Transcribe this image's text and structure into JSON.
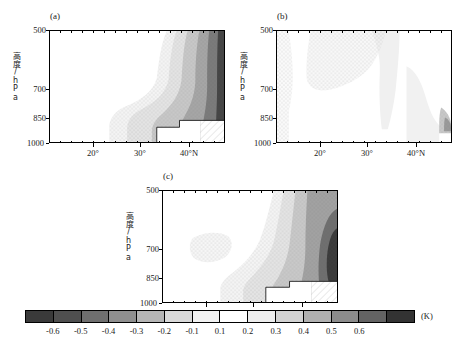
{
  "figure": {
    "unit_label": "(K)",
    "axis": {
      "ylabel": "高度/hPa",
      "ytick_labels": [
        "500",
        "700",
        "850",
        "1000"
      ],
      "ytick_values": [
        500,
        700,
        850,
        1000
      ],
      "ytick_positions_pct": [
        0,
        52,
        78,
        100
      ],
      "xtick_labels": [
        "20°",
        "30°",
        "40°N"
      ],
      "xtick_values": [
        20,
        30,
        40
      ],
      "xlim": [
        15,
        47
      ],
      "ylim_hpa": [
        500,
        1000
      ]
    },
    "panels": [
      {
        "id": "a",
        "label": "(a)"
      },
      {
        "id": "b",
        "label": "(b)"
      },
      {
        "id": "c",
        "label": "(c)"
      }
    ]
  },
  "chart_data": {
    "type": "heatmap",
    "title": "",
    "xlabel": "",
    "ylabel": "高度/hPa",
    "unit": "K",
    "grid": false,
    "legend_position": "bottom",
    "axis_ranges": {
      "x": [
        15,
        47
      ],
      "y": [
        1000,
        500
      ]
    },
    "colorbar": {
      "label": "(K)",
      "tick_labels": [
        "-0.6",
        "-0.5",
        "-0.4",
        "-0.3",
        "-0.2",
        "-0.1",
        "0.1",
        "0.2",
        "0.3",
        "0.4",
        "0.5",
        "0.6"
      ],
      "levels": [
        -0.6,
        -0.5,
        -0.4,
        -0.3,
        -0.2,
        -0.1,
        0.1,
        0.2,
        0.3,
        0.4,
        0.5,
        0.6
      ],
      "swatch_colors": [
        "#3a3a3a",
        "#4f4f4f",
        "#6f6f6f",
        "#8f8f8f",
        "#b5b5b5",
        "#d9d9d9",
        "#f2f2f2",
        "#ffffff",
        "#ededed",
        "#d2d2d2",
        "#b0b0b0",
        "#8c8c8c",
        "#636363",
        "#333333"
      ],
      "n_segments": 14
    },
    "panels": [
      {
        "id": "a",
        "label": "(a)",
        "description": "Warm anomaly band increasing eastward/northward; values rise from 0.1 K near 25°N to above 0.6 K at 46°N; white terrain mask at lower right corner.",
        "contours": [
          {
            "level": 0.1,
            "color": "#f2f2f2"
          },
          {
            "level": 0.2,
            "color": "#e0e0e0"
          },
          {
            "level": 0.3,
            "color": "#c6c6c6"
          },
          {
            "level": 0.4,
            "color": "#a8a8a8"
          },
          {
            "level": 0.5,
            "color": "#7d7d7d"
          },
          {
            "level": 0.6,
            "color": "#4a4a4a"
          }
        ]
      },
      {
        "id": "b",
        "label": "(b)",
        "description": "Weak, largely near-zero field; faint stippled positive region over the west and upper-middle troposphere; small darker patch near 45°N at 870 hPa.",
        "contours": [
          {
            "level": 0.1,
            "color": "#f6f6f6"
          },
          {
            "level": 0.2,
            "color": "#eaeaea"
          },
          {
            "level": 0.3,
            "color": "#d6d6d6"
          },
          {
            "level": 0.4,
            "color": "#b4b4b4"
          }
        ]
      },
      {
        "id": "c",
        "label": "(c)",
        "description": "Strong warm core centered near 44°N at 800 hPa exceeding 0.6 K; secondary faint patch near 22-27°N at 700 hPa; white terrain mask at lower right.",
        "contours": [
          {
            "level": 0.1,
            "color": "#f2f2f2"
          },
          {
            "level": 0.2,
            "color": "#e0e0e0"
          },
          {
            "level": 0.3,
            "color": "#c6c6c6"
          },
          {
            "level": 0.4,
            "color": "#a0a0a0"
          },
          {
            "level": 0.5,
            "color": "#6e6e6e"
          },
          {
            "level": 0.6,
            "color": "#3b3b3b"
          }
        ]
      }
    ]
  }
}
